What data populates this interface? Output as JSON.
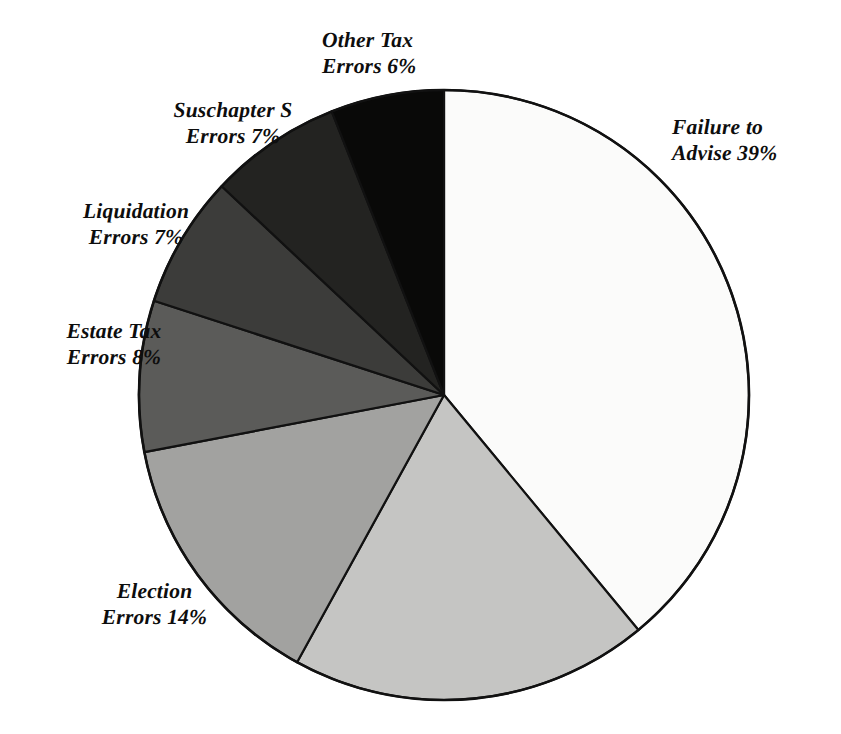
{
  "figure": {
    "background_color": "#ffffff",
    "outline_color": "#111111"
  },
  "chart_data": {
    "type": "pie",
    "title": "",
    "subtitle": "",
    "xlabel": "",
    "ylabel": "",
    "legend_position": "none",
    "grid": false,
    "label_format": "{name} {value}%",
    "start_angle_deg": 0,
    "direction": "clockwise",
    "center": {
      "x": 444,
      "y": 395,
      "radius": 305
    },
    "categories": [
      "Failure to Advise",
      "",
      "Election Errors",
      "Estate Tax Errors",
      "Liquidation Errors",
      "Suschapter S Errors",
      "Other Tax Errors"
    ],
    "values": [
      39,
      19,
      14,
      8,
      7,
      7,
      6
    ],
    "colors": [
      "#fbfbfa",
      "#c5c5c3",
      "#a2a2a0",
      "#5b5b59",
      "#3c3c3a",
      "#232321",
      "#090908"
    ],
    "slices": [
      {
        "name": "Failure to Advise",
        "value": 39,
        "label": "Failure to\nAdvise 39%",
        "color": "#fbfbfa",
        "start_deg": 0,
        "end_deg": 140.4,
        "labeled": true
      },
      {
        "name": "",
        "value": 19,
        "label": "",
        "color": "#c5c5c3",
        "start_deg": 140.4,
        "end_deg": 208.8,
        "labeled": false
      },
      {
        "name": "Election Errors",
        "value": 14,
        "label": "Election\nErrors 14%",
        "color": "#a2a2a0",
        "start_deg": 208.8,
        "end_deg": 259.2,
        "labeled": true
      },
      {
        "name": "Estate Tax Errors",
        "value": 8,
        "label": "Estate Tax\nErrors 8%",
        "color": "#5b5b59",
        "start_deg": 259.2,
        "end_deg": 288.0,
        "labeled": true
      },
      {
        "name": "Liquidation Errors",
        "value": 7,
        "label": "Liquidation\nErrors 7%",
        "color": "#3c3c3a",
        "start_deg": 288.0,
        "end_deg": 313.2,
        "labeled": true
      },
      {
        "name": "Suschapter S Errors",
        "value": 7,
        "label": "Suschapter S\nErrors 7%",
        "color": "#232321",
        "start_deg": 313.2,
        "end_deg": 338.4,
        "labeled": true
      },
      {
        "name": "Other Tax Errors",
        "value": 6,
        "label": "Other Tax\nErrors 6%",
        "color": "#090908",
        "start_deg": 338.4,
        "end_deg": 360.0,
        "labeled": true
      }
    ]
  },
  "labels": {
    "failure_to_advise": "Failure to\nAdvise 39%",
    "other_tax": "Other Tax\nErrors 6%",
    "subchapter_s": "Suschapter S\nErrors 7%",
    "liquidation": "Liquidation\nErrors 7%",
    "estate_tax": "Estate Tax\nErrors 8%",
    "election": "Election\nErrors 14%"
  }
}
